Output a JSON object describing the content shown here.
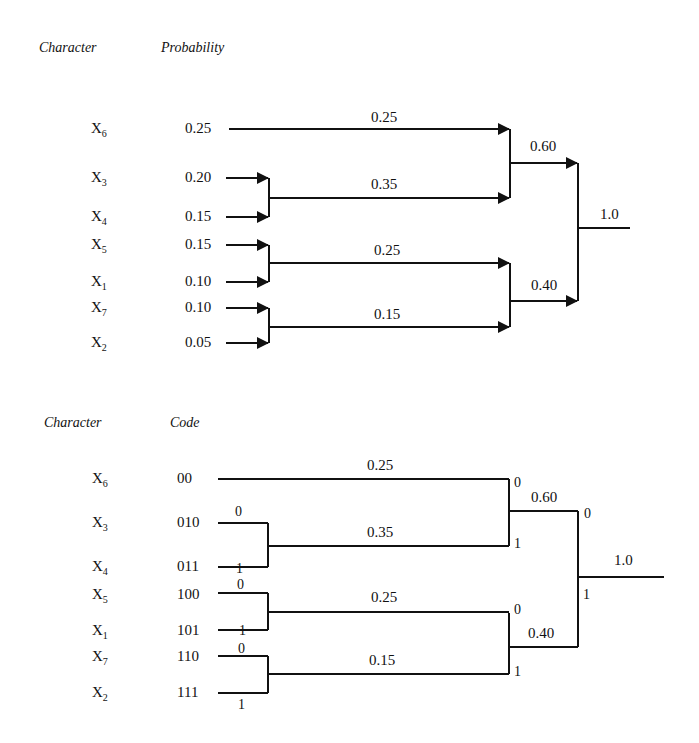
{
  "top_diagram": {
    "headers": {
      "character": "Character",
      "value": "Probability"
    },
    "rows": [
      {
        "char": "X",
        "sub": "6",
        "value": "0.25"
      },
      {
        "char": "X",
        "sub": "3",
        "value": "0.20"
      },
      {
        "char": "X",
        "sub": "4",
        "value": "0.15"
      },
      {
        "char": "X",
        "sub": "5",
        "value": "0.15"
      },
      {
        "char": "X",
        "sub": "1",
        "value": "0.10"
      },
      {
        "char": "X",
        "sub": "7",
        "value": "0.10"
      },
      {
        "char": "X",
        "sub": "2",
        "value": "0.05"
      }
    ],
    "merge_labels": {
      "n1": "0.25",
      "n2": "0.35",
      "n3": "0.25",
      "n4": "0.15",
      "n5": "0.60",
      "n6": "0.40",
      "root": "1.0"
    }
  },
  "bottom_diagram": {
    "headers": {
      "character": "Character",
      "value": "Code"
    },
    "rows": [
      {
        "char": "X",
        "sub": "6",
        "value": "00"
      },
      {
        "char": "X",
        "sub": "3",
        "value": "010"
      },
      {
        "char": "X",
        "sub": "4",
        "value": "011"
      },
      {
        "char": "X",
        "sub": "5",
        "value": "100"
      },
      {
        "char": "X",
        "sub": "1",
        "value": "101"
      },
      {
        "char": "X",
        "sub": "7",
        "value": "110"
      },
      {
        "char": "X",
        "sub": "2",
        "value": "111"
      }
    ],
    "merge_labels": {
      "n1": "0.25",
      "n2": "0.35",
      "n3": "0.25",
      "n4": "0.15",
      "n5": "0.60",
      "n6": "0.40",
      "root": "1.0"
    },
    "bits": {
      "zero": "0",
      "one": "1"
    }
  }
}
